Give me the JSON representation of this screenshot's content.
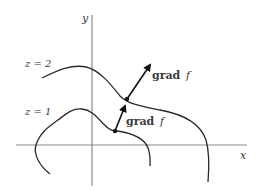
{
  "diagram": {
    "axes": {
      "x_label": "x",
      "y_label": "y"
    },
    "level_curves": [
      {
        "label": "z = 2",
        "value": 2
      },
      {
        "label": "z = 1",
        "value": 1
      }
    ],
    "gradient_vectors": [
      {
        "label_bold": "grad",
        "label_italic": "f",
        "on_curve": "z = 2"
      },
      {
        "label_bold": "grad",
        "label_italic": "f",
        "on_curve": "z = 1"
      }
    ],
    "colors": {
      "curve": "#2a2a2a",
      "axis": "#8a8a8a",
      "text": "#3a3a3a"
    }
  }
}
